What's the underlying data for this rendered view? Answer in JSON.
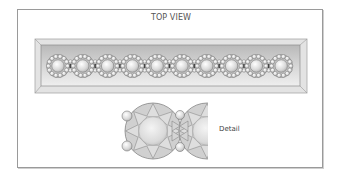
{
  "diagram": {
    "title": "TOP VIEW",
    "detail_label": "Detail",
    "band": {
      "link_count": 10,
      "first_link_x": 58,
      "link_spacing": 24.8,
      "center_y": 66
    },
    "colors": {
      "frame_border": "#9a9a9a",
      "band_outer": "#e2e2e2",
      "band_top": "#bdbdbd",
      "band_bottom": "#ececec",
      "stone_stroke": "#6e6e6e",
      "stone_fill": "#d6d6d6",
      "text": "#555555"
    }
  }
}
